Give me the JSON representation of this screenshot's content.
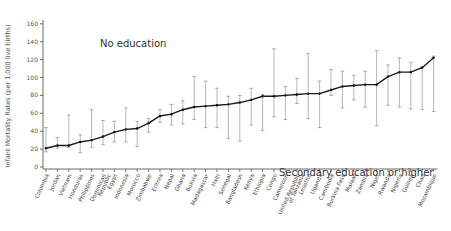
{
  "chart_data": {
    "type": "line",
    "title": "",
    "xlabel": "",
    "ylabel": "Infant Mortality Rates (per 1,000 live births)",
    "ylim": [
      0,
      160
    ],
    "yticks": [
      0,
      20,
      40,
      60,
      80,
      100,
      120,
      140,
      160
    ],
    "grid": false,
    "legend": null,
    "annotations": [
      {
        "text": "No education",
        "position": "upper-left"
      },
      {
        "text": "Secondary education or higher",
        "position": "lower-right"
      }
    ],
    "categories": [
      "Colombia",
      "Jordan",
      "Vietnam",
      "Honduras",
      "Philippines",
      "Dominican Republic",
      "Egypt",
      "Indonesia",
      "Morocco",
      "Zimbabwe",
      "Eritrea",
      "Nepal",
      "Ghana",
      "Bolivia",
      "Madagascar",
      "Haiti",
      "Senegal",
      "Bangladesh",
      "Kenya",
      "Ethiopia",
      "Congo",
      "Cameroon",
      "United Republic of Tanzania",
      "Lesotho",
      "Uganda",
      "Cambodia",
      "Burkina Faso",
      "Malawi",
      "Zambia",
      "Niger",
      "Rwanda",
      "Nigeria",
      "Guinea",
      "Chad",
      "Mozambique"
    ],
    "series": [
      {
        "name": "Average",
        "values": [
          21,
          24,
          24,
          28,
          30,
          34,
          39,
          42,
          43,
          49,
          57,
          59,
          64,
          67,
          68,
          69,
          70,
          72,
          75,
          79,
          79,
          80,
          81,
          82,
          82,
          86,
          90,
          91,
          92,
          92,
          101,
          106,
          106,
          111,
          122
        ]
      },
      {
        "name": "No education (upper bar)",
        "values": [
          44,
          33,
          58,
          36,
          64,
          52,
          51,
          66,
          51,
          54,
          64,
          70,
          74,
          101,
          96,
          88,
          79,
          80,
          88,
          81,
          132,
          90,
          99,
          127,
          96,
          109,
          107,
          102,
          107,
          130,
          114,
          122,
          117,
          112,
          124
        ]
      },
      {
        "name": "Secondary education or higher (lower bar)",
        "values": [
          17,
          21,
          22,
          16,
          22,
          25,
          28,
          28,
          23,
          39,
          50,
          47,
          48,
          53,
          44,
          44,
          32,
          29,
          47,
          41,
          56,
          53,
          71,
          54,
          44,
          80,
          66,
          75,
          67,
          46,
          69,
          67,
          65,
          64,
          62
        ]
      }
    ]
  }
}
